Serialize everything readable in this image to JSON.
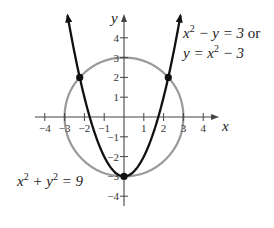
{
  "chart_data": {
    "type": "line",
    "title": "",
    "xlabel": "x",
    "ylabel": "y",
    "xlim": [
      -4.5,
      4.8
    ],
    "ylim": [
      -4.5,
      5.2
    ],
    "grid": false,
    "x_ticks": [
      -4,
      -3,
      -2,
      -1,
      1,
      2,
      3,
      4
    ],
    "y_ticks": [
      -4,
      -3,
      -2,
      -1,
      1,
      2,
      3,
      4
    ],
    "x_tick_labels": [
      "−4",
      "−3",
      "−2",
      "−1",
      "1",
      "2",
      "3",
      "4"
    ],
    "y_tick_labels": [
      "−4",
      "−3",
      "−2",
      "−1",
      "1",
      "2",
      "3",
      "4"
    ],
    "series": [
      {
        "name": "x^2 + y^2 = 9",
        "kind": "circle",
        "center": [
          0,
          0
        ],
        "radius": 3,
        "color": "#9a9a9a"
      },
      {
        "name": "y = x^2 - 3",
        "kind": "parabola",
        "equation": "y = x^2 - 3",
        "x_range": [
          -2.85,
          2.85
        ],
        "color": "#111111",
        "arrows": true
      }
    ],
    "points": [
      {
        "x": -2.236,
        "y": 2,
        "label": "(-√5, 2)"
      },
      {
        "x": 2.236,
        "y": 2,
        "label": "(√5, 2)"
      },
      {
        "x": 0,
        "y": -3,
        "label": "(0, -3)"
      }
    ],
    "annotations": [
      {
        "text_line1": "x² − y = 3 or",
        "text_line2": "y = x² − 3",
        "target": "parabola"
      },
      {
        "text": "x² + y² = 9",
        "target": "circle"
      }
    ]
  },
  "labels": {
    "x_axis": "x",
    "y_axis": "y",
    "parabola_line1_a": "x",
    "parabola_line1_exp": "2",
    "parabola_line1_b": " − y = 3 ",
    "parabola_line1_or": "or",
    "parabola_line2_a": "y = x",
    "parabola_line2_exp": "2",
    "parabola_line2_b": " − 3",
    "circle_a": "x",
    "circle_exp1": "2",
    "circle_b": " + y",
    "circle_exp2": "2",
    "circle_c": " = 9"
  }
}
